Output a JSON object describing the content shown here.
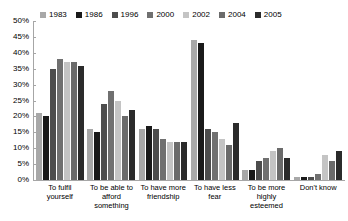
{
  "chart_data": {
    "type": "bar",
    "title": "",
    "subtitle": "",
    "xlabel": "",
    "ylabel": "",
    "ylim": [
      0,
      50
    ],
    "ytick_labels": [
      "50%",
      "45%",
      "40%",
      "35%",
      "30%",
      "25%",
      "20%",
      "15%",
      "10%",
      "5%",
      "0%"
    ],
    "ytick_values": [
      50,
      45,
      40,
      35,
      30,
      25,
      20,
      15,
      10,
      5,
      0
    ],
    "grid": false,
    "legend_position": "top",
    "value_suffix": "%",
    "categories": [
      "To fulfil yourself",
      "To be able to afford something",
      "To have more friendship",
      "To have less fear",
      "To be more highly esteemed",
      "Don't know"
    ],
    "series": [
      {
        "name": "1983",
        "color": "#a8a8a8",
        "values": [
          21,
          16,
          16,
          44,
          3,
          1
        ]
      },
      {
        "name": "1986",
        "color": "#1a1a1a",
        "values": [
          20,
          15,
          17,
          43,
          3,
          1
        ]
      },
      {
        "name": "1996",
        "color": "#4d4d4d",
        "values": [
          35,
          24,
          16,
          16,
          6,
          1
        ]
      },
      {
        "name": "2000",
        "color": "#707070",
        "values": [
          38,
          28,
          13,
          15,
          7,
          2
        ]
      },
      {
        "name": "2002",
        "color": "#c4c4c4",
        "values": [
          37,
          25,
          12,
          13,
          9,
          8
        ]
      },
      {
        "name": "2004",
        "color": "#6b6b6b",
        "values": [
          37,
          20,
          12,
          11,
          10,
          6
        ]
      },
      {
        "name": "2005",
        "color": "#2b2b2b",
        "values": [
          36,
          22,
          12,
          18,
          7,
          9
        ]
      }
    ]
  }
}
